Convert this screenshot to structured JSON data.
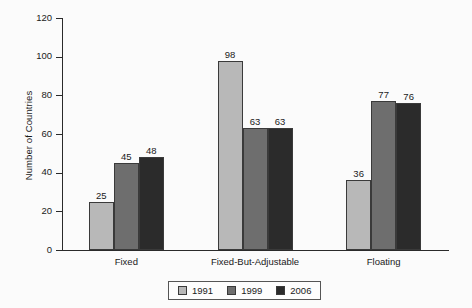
{
  "chart_data": {
    "type": "bar",
    "title": "",
    "subtitle": "",
    "xlabel": "",
    "ylabel": "Number of Countries",
    "ylim": [
      0,
      120
    ],
    "ytick_labels": [
      "0",
      "20",
      "40",
      "60",
      "80",
      "100",
      "120"
    ],
    "ytick_values": [
      0,
      20,
      40,
      60,
      80,
      100,
      120
    ],
    "grid": false,
    "legend_position": "bottom-center",
    "categories": [
      "Fixed",
      "Fixed-But-Adjustable",
      "Floating"
    ],
    "series": [
      {
        "name": "1991",
        "color": "#b8b8b8",
        "values": [
          25,
          98,
          36
        ]
      },
      {
        "name": "1999",
        "color": "#6e6e6e",
        "values": [
          45,
          63,
          77
        ]
      },
      {
        "name": "2006",
        "color": "#2b2b2b",
        "values": [
          48,
          63,
          76
        ]
      }
    ],
    "value_labels": [
      [
        "25",
        "45",
        "48"
      ],
      [
        "98",
        "63",
        "63"
      ],
      [
        "36",
        "77",
        "76"
      ]
    ]
  },
  "legend": {
    "items": [
      {
        "label": "1991"
      },
      {
        "label": "1999"
      },
      {
        "label": "2006"
      }
    ]
  },
  "colors": {
    "background": "#fbfbfb",
    "axis": "#2a2a2a",
    "text": "#1a1a1a",
    "series_1991": "#b8b8b8",
    "series_1999": "#6e6e6e",
    "series_2006": "#2b2b2b"
  }
}
